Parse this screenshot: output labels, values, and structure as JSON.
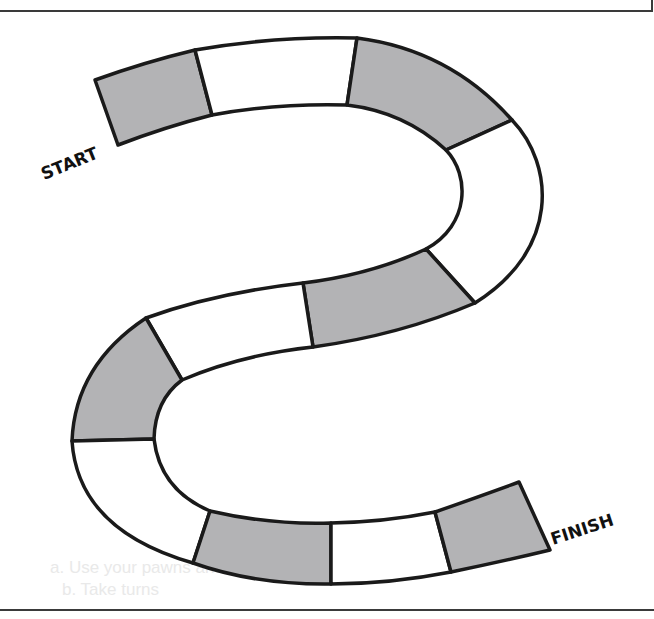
{
  "board": {
    "title": "S-shaped board game path",
    "start_label": "START",
    "finish_label": "FINISH",
    "colors": {
      "outline": "#1a1a1a",
      "shaded_space": "#b3b3b5",
      "plain_space": "#ffffff",
      "background": "#ffffff"
    },
    "spaces": [
      {
        "index": 1,
        "fill": "shaded",
        "role": "start"
      },
      {
        "index": 2,
        "fill": "plain"
      },
      {
        "index": 3,
        "fill": "shaded"
      },
      {
        "index": 4,
        "fill": "plain"
      },
      {
        "index": 5,
        "fill": "shaded"
      },
      {
        "index": 6,
        "fill": "plain"
      },
      {
        "index": 7,
        "fill": "shaded"
      },
      {
        "index": 8,
        "fill": "plain"
      },
      {
        "index": 9,
        "fill": "shaded"
      },
      {
        "index": 10,
        "fill": "plain"
      },
      {
        "index": 11,
        "fill": "shaded",
        "role": "finish"
      }
    ],
    "space_count": 11
  },
  "bleed_through_text": {
    "line1": "a. Use your pawns and shuffle a deck of directions",
    "line2": "b. Take turns"
  }
}
